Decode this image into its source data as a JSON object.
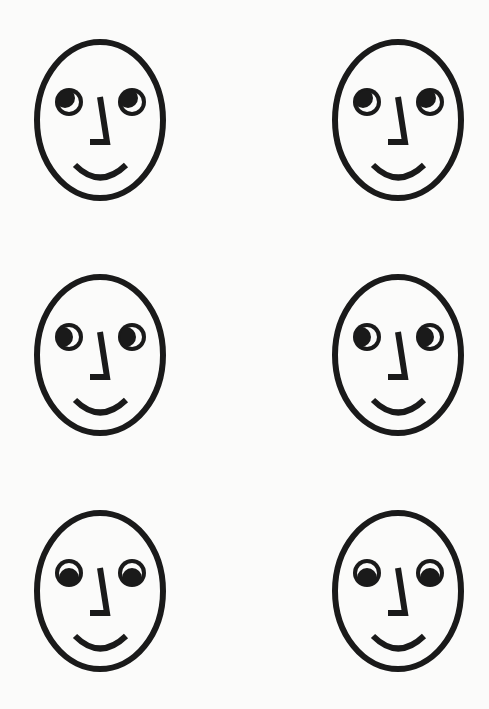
{
  "figure": {
    "stroke_color": "#1a1a1a",
    "background": "#fbfbfa",
    "faces": [
      {
        "row": 1,
        "col": 1,
        "x": 20,
        "y": 32,
        "gaze": "up-left",
        "pupil_dx": -4,
        "pupil_dy": -4
      },
      {
        "row": 1,
        "col": 2,
        "x": 318,
        "y": 32,
        "gaze": "up-left",
        "pupil_dx": -4,
        "pupil_dy": -4
      },
      {
        "row": 2,
        "col": 1,
        "x": 20,
        "y": 267,
        "gaze": "left",
        "pupil_dx": -6,
        "pupil_dy": 0
      },
      {
        "row": 2,
        "col": 2,
        "x": 318,
        "y": 267,
        "gaze": "left",
        "pupil_dx": -6,
        "pupil_dy": 0
      },
      {
        "row": 3,
        "col": 1,
        "x": 20,
        "y": 503,
        "gaze": "down",
        "pupil_dx": 0,
        "pupil_dy": 5
      },
      {
        "row": 3,
        "col": 2,
        "x": 318,
        "y": 503,
        "gaze": "down",
        "pupil_dx": 0,
        "pupil_dy": 5
      }
    ]
  }
}
